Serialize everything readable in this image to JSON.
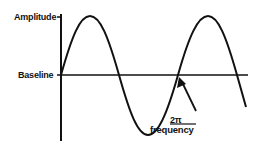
{
  "labels": {
    "amplitude": "Amplitude",
    "baseline": "Baseline",
    "period_numerator": "2π",
    "period_denominator": "frequency"
  },
  "colors": {
    "stroke": "#111111",
    "background": "#ffffff"
  },
  "diagram": {
    "type": "sine-wave",
    "cycles_shown": 1.75,
    "annotations": [
      "Amplitude (peak marker on vertical axis)",
      "Baseline (horizontal axis)",
      "Arrow pointing to zero crossing labeled 2π / frequency"
    ]
  }
}
